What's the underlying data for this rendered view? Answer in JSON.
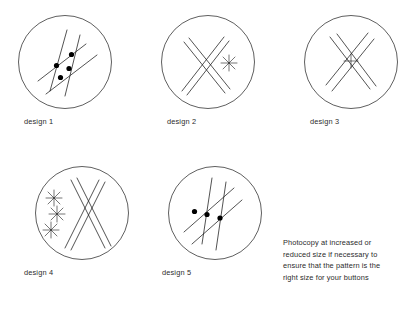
{
  "page": {
    "background_color": "#ffffff",
    "ink_color": "#1a1a1a"
  },
  "designs": [
    {
      "id": "design-1",
      "label": "design 1",
      "circle": {
        "cx": 65,
        "cy": 62,
        "r": 47
      },
      "motif": "four crossing lines with four filled dots at intersections",
      "dots": 4
    },
    {
      "id": "design-2",
      "label": "design 2",
      "circle": {
        "cx": 208,
        "cy": 62,
        "r": 47
      },
      "motif": "large X of four crossing lines with a small asterisk to the right",
      "dots": 0
    },
    {
      "id": "design-3",
      "label": "design 3",
      "circle": {
        "cx": 351,
        "cy": 62,
        "r": 47
      },
      "motif": "large X of crossing lines with a small plus star at the centre",
      "dots": 0
    },
    {
      "id": "design-4",
      "label": "design 4",
      "circle": {
        "cx": 82,
        "cy": 213,
        "r": 47
      },
      "motif": "narrow X of four long lines with three small asterisks at the left",
      "dots": 0
    },
    {
      "id": "design-5",
      "label": "design 5",
      "circle": {
        "cx": 215,
        "cy": 213,
        "r": 47
      },
      "motif": "four crossing lines with three filled dots in a row",
      "dots": 3
    }
  ],
  "note": {
    "lines": [
      "Photocopy at increased or",
      "reduced size if necessary to",
      "ensure that the pattern is the",
      "right size for your buttons"
    ]
  }
}
